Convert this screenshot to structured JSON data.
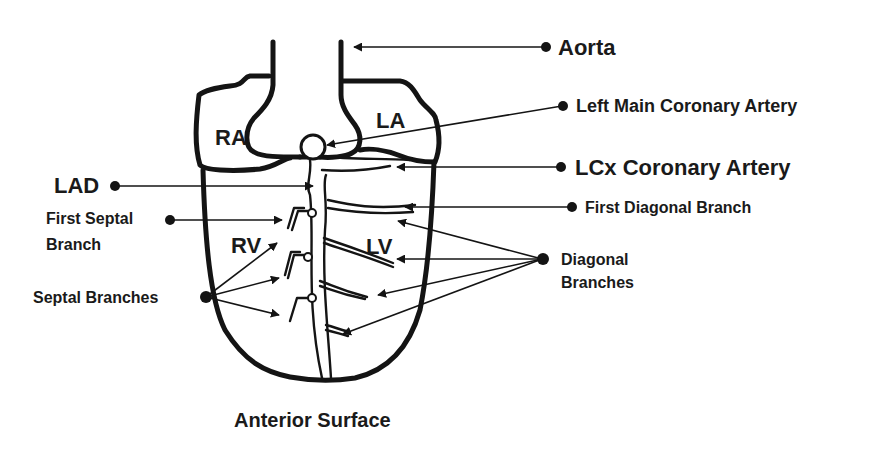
{
  "diagram": {
    "title": "Anterior Surface",
    "chambers": {
      "ra": "RA",
      "la": "LA",
      "rv": "RV",
      "lv": "LV"
    },
    "labels": {
      "aorta": "Aorta",
      "left_main": "Left Main Coronary Artery",
      "lcx": "LCx Coronary Artery",
      "first_diagonal": "First Diagonal Branch",
      "diagonal_line1": "Diagonal",
      "diagonal_line2": "Branches",
      "lad": "LAD",
      "first_septal_line1": "First Septal",
      "first_septal_line2": "Branch",
      "septal_branches": "Septal Branches"
    },
    "colors": {
      "ink": "#141414",
      "background": "#ffffff"
    }
  }
}
